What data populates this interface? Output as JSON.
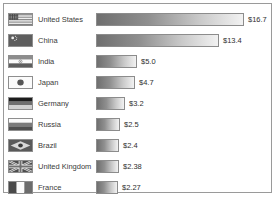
{
  "chart_data": {
    "type": "bar",
    "title": "",
    "subtitle": "",
    "xlabel": "",
    "ylabel": "",
    "orientation": "horizontal",
    "grid": false,
    "legend": "none",
    "axis_visible": false,
    "xlim": [
      0,
      16.7
    ],
    "categories": [
      "United States",
      "China",
      "India",
      "Japan",
      "Germany",
      "Russia",
      "Brazil",
      "United Kingdom",
      "France"
    ],
    "values": [
      16.7,
      13.4,
      5.0,
      4.7,
      3.2,
      2.5,
      2.4,
      2.38,
      2.27
    ],
    "value_labels": [
      "$16.7",
      "$13.4",
      "$5.0",
      "$4.7",
      "$3.2",
      "$2.5",
      "$2.4",
      "$2.38",
      "$2.27"
    ],
    "bar_style": {
      "fill": "gradient-gray-dark-to-light",
      "border": "#8c8c8c",
      "gradient_from": "#6f6f6f",
      "gradient_to": "#f2f2f2"
    }
  },
  "frame": {
    "border_color": "#9a9a9a",
    "background": "#ffffff"
  },
  "rows": [
    {
      "country": "United States",
      "value_label": "$16.7",
      "flag_icon": "flag-united-states",
      "bar_width_px": 148,
      "label_offset_px": 152
    },
    {
      "country": "China",
      "value_label": "$13.4",
      "flag_icon": "flag-china",
      "bar_width_px": 123,
      "label_offset_px": 127
    },
    {
      "country": "India",
      "value_label": "$5.0",
      "flag_icon": "flag-india",
      "bar_width_px": 41,
      "label_offset_px": 45
    },
    {
      "country": "Japan",
      "value_label": "$4.7",
      "flag_icon": "flag-japan",
      "bar_width_px": 39,
      "label_offset_px": 43
    },
    {
      "country": "Germany",
      "value_label": "$3.2",
      "flag_icon": "flag-germany",
      "bar_width_px": 29,
      "label_offset_px": 33
    },
    {
      "country": "Russia",
      "value_label": "$2.5",
      "flag_icon": "flag-russia",
      "bar_width_px": 24,
      "label_offset_px": 28
    },
    {
      "country": "Brazil",
      "value_label": "$2.4",
      "flag_icon": "flag-brazil",
      "bar_width_px": 23,
      "label_offset_px": 27
    },
    {
      "country": "United Kingdom",
      "value_label": "$2.38",
      "flag_icon": "flag-united-kingdom",
      "bar_width_px": 23,
      "label_offset_px": 27
    },
    {
      "country": "France",
      "value_label": "$2.27",
      "flag_icon": "flag-france",
      "bar_width_px": 22,
      "label_offset_px": 26
    }
  ]
}
